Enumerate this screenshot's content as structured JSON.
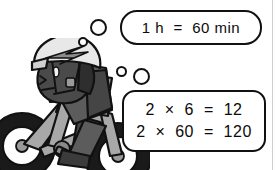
{
  "scene": {
    "title": "Cyclist thinking about time conversion",
    "background_color": "#ffffff",
    "width": 280,
    "height": 170
  },
  "bubbles": [
    {
      "id": "bubble-1",
      "lines": [
        "1 h  =  60 min"
      ]
    },
    {
      "id": "bubble-2",
      "lines": [
        "2  ×  6  =  12",
        "2  ×  60  =  120"
      ]
    }
  ],
  "thought_dots": [
    {
      "name": "thought-dot-small-1"
    },
    {
      "name": "thought-dot-medium-1"
    },
    {
      "name": "thought-dot-small-2"
    },
    {
      "name": "thought-dot-medium-2"
    }
  ],
  "character": {
    "name": "cyclist",
    "description": "Child riding a bicycle, side view, wearing a helmet",
    "helmet_color": "#e8e8e8",
    "helmet_stripe_color": "#8c8c8c",
    "skin_color": "#4a4a4a",
    "shirt_color": "#5c5c5c",
    "shirt_shadow_color": "#3f3f3f",
    "bike_frame_color": "#a8a8a8",
    "bike_tire_color": "#1a1a1a",
    "outline_color": "#111111"
  },
  "colors": {
    "ink": "#111111",
    "paper": "#ffffff",
    "page_edge": "#cfcfcf"
  }
}
